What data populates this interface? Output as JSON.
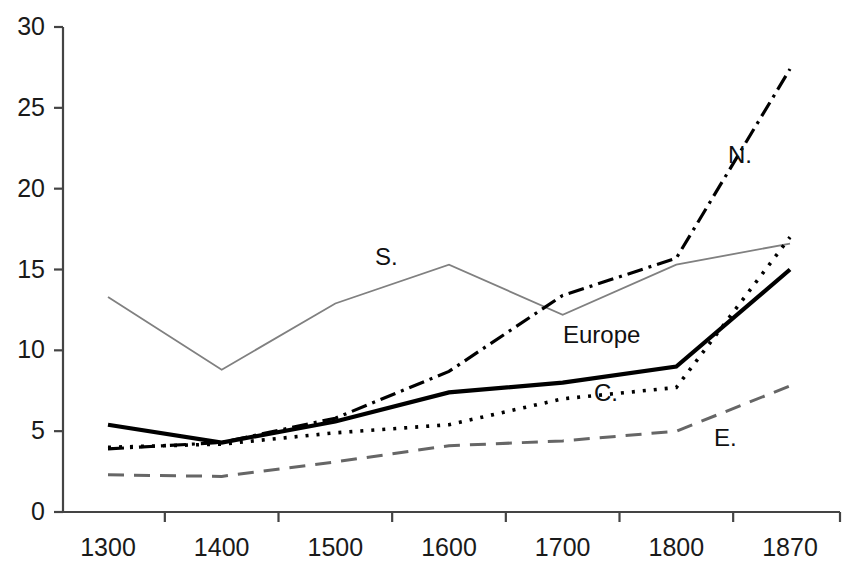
{
  "chart_data": {
    "type": "line",
    "title": "",
    "xlabel": "",
    "ylabel": "",
    "categories": [
      "1300",
      "1400",
      "1500",
      "1600",
      "1700",
      "1800",
      "1870"
    ],
    "ylim": [
      0,
      30
    ],
    "yticks": [
      0,
      5,
      10,
      15,
      20,
      25,
      30
    ],
    "ytick_labels": [
      "0",
      "5",
      "10",
      "15",
      "20",
      "25",
      "30"
    ],
    "grid": false,
    "legend": "inline-annotations",
    "series": [
      {
        "name": "S.",
        "label": "S.",
        "style": "solid-thin",
        "color": "#808080",
        "values": [
          13.3,
          8.8,
          12.9,
          15.3,
          12.2,
          15.3,
          16.6
        ]
      },
      {
        "name": "N.",
        "label": "N.",
        "style": "dash-dot",
        "color": "#000000",
        "values": [
          3.9,
          4.3,
          5.8,
          8.7,
          13.4,
          15.7,
          27.4
        ]
      },
      {
        "name": "Europe",
        "label": "Europe",
        "style": "solid-thick",
        "color": "#000000",
        "values": [
          5.4,
          4.3,
          5.6,
          7.4,
          8.0,
          9.0,
          15.0
        ]
      },
      {
        "name": "C.",
        "label": "C.",
        "style": "dotted",
        "color": "#000000",
        "values": [
          4.0,
          4.2,
          4.9,
          5.4,
          7.0,
          7.7,
          17.0
        ]
      },
      {
        "name": "E.",
        "label": "E.",
        "style": "dashed",
        "color": "#666666",
        "values": [
          2.3,
          2.2,
          3.1,
          4.1,
          4.4,
          5.0,
          7.8
        ]
      }
    ],
    "annotations": [
      {
        "text": "S.",
        "x_px": 375,
        "y_px": 245
      },
      {
        "text": "N.",
        "x_px": 728,
        "y_px": 143
      },
      {
        "text": "Europe",
        "x_px": 563,
        "y_px": 323
      },
      {
        "text": "C.",
        "x_px": 594,
        "y_px": 381
      },
      {
        "text": "E.",
        "x_px": 714,
        "y_px": 426
      }
    ],
    "axis_color": "#444444",
    "plot_left_px": 63,
    "plot_right_px": 840,
    "plot_top_px": 27,
    "plot_bottom_px": 512
  }
}
